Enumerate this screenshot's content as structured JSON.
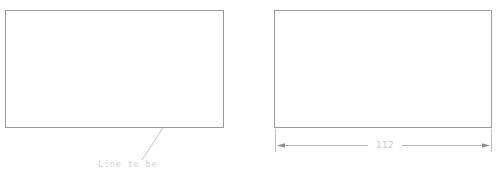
{
  "drawing": {
    "type": "technical-cad-drawing",
    "background_color": "#ffffff",
    "line_color": "#9a9a9a",
    "text_color": "#cfcfcf",
    "panels": [
      {
        "id": "left-panel",
        "name": "selection-step",
        "shape": {
          "kind": "rectangle",
          "x": 5,
          "y": 10,
          "width": 219,
          "height": 118
        },
        "leader": {
          "from_x": 163,
          "from_y": 128,
          "to_x": 142,
          "to_y": 160
        },
        "annotation": {
          "line1": "Line to be",
          "line2": "selected"
        }
      },
      {
        "id": "right-panel",
        "name": "dimension-step",
        "shape": {
          "kind": "rectangle",
          "x": 274,
          "y": 10,
          "width": 218,
          "height": 118
        },
        "dimension": {
          "value": "112",
          "orientation": "horizontal",
          "line_y": 145,
          "start_x": 277,
          "end_x": 490,
          "extension_top_y": 129,
          "extension_bottom_y": 152,
          "arrowheads": "both"
        }
      }
    ]
  }
}
